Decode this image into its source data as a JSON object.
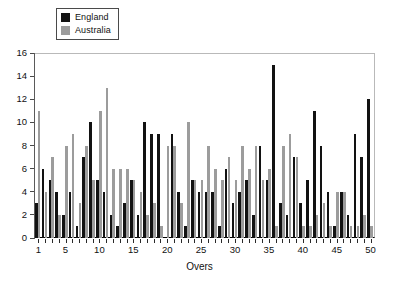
{
  "chart_data": {
    "type": "bar",
    "title": "",
    "xlabel": "Overs",
    "ylabel": "",
    "xlim": [
      0.5,
      50.5
    ],
    "ylim": [
      0,
      16
    ],
    "grid": false,
    "legend_position": "top-left",
    "x": [
      1,
      2,
      3,
      4,
      5,
      6,
      7,
      8,
      9,
      10,
      11,
      12,
      13,
      14,
      15,
      16,
      17,
      18,
      19,
      20,
      21,
      22,
      23,
      24,
      25,
      26,
      27,
      28,
      29,
      30,
      31,
      32,
      33,
      34,
      35,
      36,
      37,
      38,
      39,
      40,
      41,
      42,
      43,
      44,
      45,
      46,
      47,
      48,
      49,
      50
    ],
    "categories": [
      "1",
      "2",
      "3",
      "4",
      "5",
      "6",
      "7",
      "8",
      "9",
      "10",
      "11",
      "12",
      "13",
      "14",
      "15",
      "16",
      "17",
      "18",
      "19",
      "20",
      "21",
      "22",
      "23",
      "24",
      "25",
      "26",
      "27",
      "28",
      "29",
      "30",
      "31",
      "32",
      "33",
      "34",
      "35",
      "36",
      "37",
      "38",
      "39",
      "40",
      "41",
      "42",
      "43",
      "44",
      "45",
      "46",
      "47",
      "48",
      "49",
      "50"
    ],
    "xticks": [
      1,
      5,
      10,
      15,
      20,
      25,
      30,
      35,
      40,
      45,
      50
    ],
    "xticklabels": [
      "1",
      "5",
      "10",
      "15",
      "20",
      "25",
      "30",
      "35",
      "40",
      "45",
      "50"
    ],
    "yticks": [
      0,
      2,
      4,
      6,
      8,
      10,
      12,
      14,
      16
    ],
    "yticklabels": [
      "0",
      "2",
      "4",
      "6",
      "8",
      "10",
      "12",
      "14",
      "16"
    ],
    "series": [
      {
        "name": "England",
        "color": "#121212",
        "values": [
          3,
          6,
          5,
          4,
          2,
          4,
          1,
          7,
          10,
          5,
          4,
          2,
          1,
          3,
          5,
          2,
          10,
          9,
          9,
          0,
          9,
          4,
          1,
          5,
          4,
          4,
          4,
          1,
          6,
          3,
          4,
          5,
          2,
          8,
          5,
          15,
          3,
          2,
          7,
          3,
          5,
          11,
          8,
          4,
          1,
          4,
          2,
          9,
          7,
          12
        ]
      },
      {
        "name": "Australia",
        "color": "#9c9c9c",
        "values": [
          11,
          4,
          7,
          2,
          8,
          9,
          3,
          8,
          5,
          11,
          13,
          6,
          6,
          6,
          5,
          4,
          2,
          3,
          1,
          8,
          8,
          3,
          10,
          5,
          5,
          8,
          6,
          5,
          7,
          5,
          8,
          6,
          8,
          5,
          6,
          1,
          8,
          9,
          7,
          1,
          1,
          2,
          3,
          1,
          4,
          4,
          1,
          1,
          2,
          1
        ]
      }
    ]
  },
  "legend": {
    "entries": [
      {
        "label": "England",
        "color": "#121212",
        "swatch": "black-square-swatch"
      },
      {
        "label": "Australia",
        "color": "#9c9c9c",
        "swatch": "gray-square-swatch"
      }
    ]
  },
  "axes": {
    "x_title": "Overs"
  }
}
